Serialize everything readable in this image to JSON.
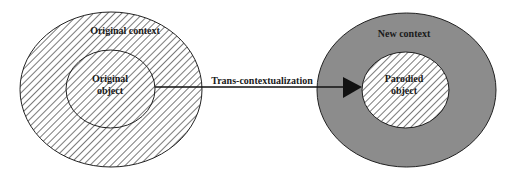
{
  "diagram": {
    "type": "concentric-context-diagram",
    "left": {
      "outer_label": "Original context",
      "inner_label_line1": "Original",
      "inner_label_line2": "object",
      "fill": "hatched-diagonal"
    },
    "right": {
      "outer_label": "New context",
      "inner_label_line1": "Parodied",
      "inner_label_line2": "object",
      "outer_fill": "#8c8c8c",
      "inner_fill": "hatched-diagonal"
    },
    "arrow": {
      "label": "Trans-contextualization",
      "from": "Original object",
      "to": "Parodied object"
    },
    "colors": {
      "stroke": "#222222",
      "hatch": "#7a7a7a",
      "gray_fill": "#8c8c8c",
      "background": "#ffffff"
    }
  }
}
